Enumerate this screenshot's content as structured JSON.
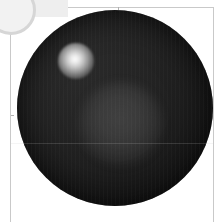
{
  "app": {
    "title": "Sphere Render Viewport",
    "canvas_width": 223,
    "canvas_height": 222,
    "background_color": "#ffffff"
  },
  "corner_widget": {
    "name": "cropped-circular-badge",
    "visible_label": "",
    "stroke_color": "#d6d6d6",
    "fill_color": "#f2f2f2"
  },
  "plot_frame": {
    "axis_color": "#c9c9c9",
    "tick_color": "#b0b0b0",
    "top_tick_x": 118,
    "left_tick_y": 115,
    "axis_labels": []
  },
  "render": {
    "object": "shaded-sphere",
    "sphere": {
      "center_x": 109,
      "center_y": 108,
      "radius": 98,
      "base_color": "#1f1f1f",
      "highlight_color": "#2a2a2a",
      "shadow_color": "#111111"
    },
    "specular_highlight": {
      "name": "specular-highlight",
      "center_x": 76,
      "center_y": 61,
      "radius": 18,
      "peak_color": "#fdfdfd"
    },
    "diffuse_glow": {
      "name": "diffuse-glow",
      "center_x": 121,
      "center_y": 124,
      "radius": 42,
      "color": "#bebebe",
      "opacity": 0.19
    },
    "scan_line": {
      "name": "equator-scan-line",
      "y": 143,
      "color": "#c8c8c8"
    }
  }
}
